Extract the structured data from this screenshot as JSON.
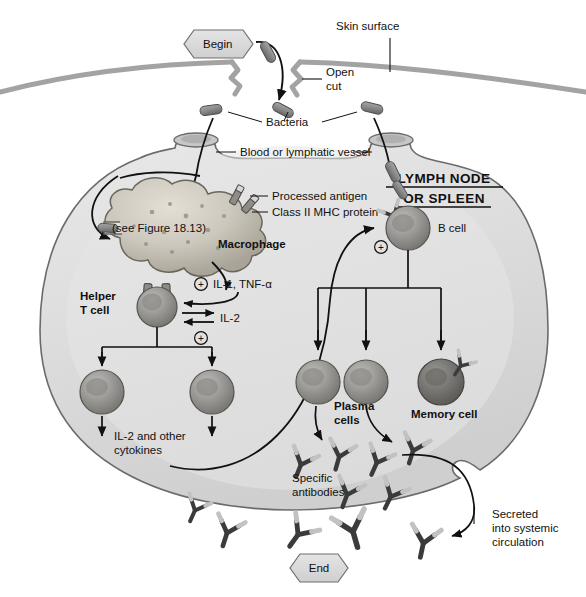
{
  "figure": {
    "colors": {
      "node_fill": "#dcdcdc",
      "node_fill_light": "#e8e8e8",
      "outline": "#3a3a3a",
      "bacteria": "#8c8c8c",
      "cell_mid": "#9a9a9a",
      "cell_dark": "#6f6f6f",
      "macrophage": "#c9c4bb",
      "antibody_dark": "#3b3b3b",
      "antibody_light": "#c4c4c4",
      "skin_line": "#9b9b9b",
      "flowbox": "#d9d9d9"
    }
  },
  "flow": {
    "begin_label": "Begin",
    "end_label": "End"
  },
  "labels": {
    "skin_surface": "Skin surface",
    "open_cut_line1": "Open",
    "open_cut_line2": "cut",
    "bacteria": "Bacteria",
    "vessel": "Blood or lymphatic vessel",
    "lymph_node_line1": "LYMPH NODE",
    "lymph_node_line2": "OR SPLEEN",
    "processed_antigen": "Processed antigen",
    "mhc_protein": "Class II MHC protein",
    "macrophage": "Macrophage",
    "see_figure": "(see Figure 18.13)",
    "helper_t_line1": "Helper",
    "helper_t_line2": "T cell",
    "il1_tnf": "IL-1, TNF-α",
    "il2": "IL-2",
    "il2_other_line1": "IL-2 and other",
    "il2_other_line2": "cytokines",
    "b_cell": "B cell",
    "plasma_line1": "Plasma",
    "plasma_line2": "cells",
    "memory_cell": "Memory cell",
    "specific_line1": "Specific",
    "specific_line2": "antibodies",
    "secreted_line1": "Secreted",
    "secreted_line2": "into systemic",
    "secreted_line3": "circulation",
    "plus_sign": "+"
  },
  "cells": {
    "macrophage": {
      "name": "Macrophage",
      "kind": "antigen-presenting-cell"
    },
    "helper_t": {
      "name": "Helper T cell",
      "kind": "lymphocyte"
    },
    "t_clone_left": {
      "name": "Activated helper T cell",
      "kind": "lymphocyte"
    },
    "t_clone_right": {
      "name": "Activated helper T cell",
      "kind": "lymphocyte"
    },
    "b_cell": {
      "name": "B cell",
      "kind": "lymphocyte"
    },
    "plasma_left": {
      "name": "Plasma cell",
      "kind": "effector"
    },
    "plasma_right": {
      "name": "Plasma cell",
      "kind": "effector"
    },
    "memory": {
      "name": "Memory cell",
      "kind": "memory"
    }
  },
  "counts": {
    "bacteria_outside": 3,
    "bacteria_in_vessel": 2,
    "antibodies_inside_node": 6,
    "antibodies_outside_node": 5,
    "plasma_cells": 2,
    "t_cell_clones": 2
  }
}
